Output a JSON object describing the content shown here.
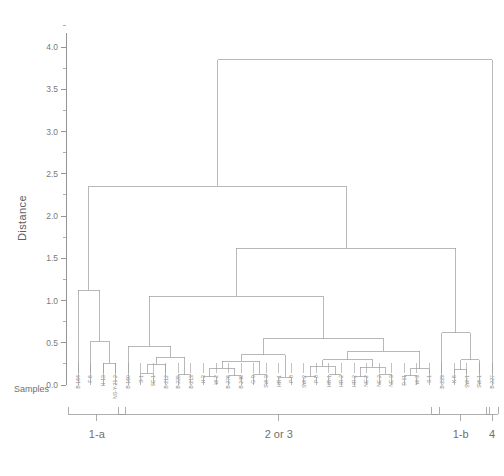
{
  "figure": {
    "kind": "dendrogram",
    "y_axis_title": "Distance",
    "x_axis_title": "Samples"
  },
  "chart_data": {
    "type": "line",
    "title": "",
    "subtitle": "",
    "xlabel": "Samples",
    "ylabel": "Distance",
    "ylim": [
      0.0,
      4.2
    ],
    "grid": false,
    "legend": "none",
    "yticks": [
      "0.0",
      "0.5",
      "1.0",
      "1.5",
      "2.0",
      "2.5",
      "3.0",
      "3.5",
      "4.0"
    ],
    "ytick_values": [
      0.0,
      0.5,
      1.0,
      1.5,
      2.0,
      2.5,
      3.0,
      3.5,
      4.0
    ],
    "minor_ticks": true,
    "leaf_labels": [
      "B-164",
      "F-6",
      "H-13",
      "NS-Y-21-2",
      "B-160",
      "S-1",
      "SE-1",
      "B-212",
      "B-225",
      "B-213",
      "H-3",
      "W-2",
      "B-276",
      "B-246",
      "G-9",
      "SW-3",
      "HR-1",
      "P-8",
      "SW-2",
      "P-8",
      "HR-1",
      "HR-2",
      "HR-2",
      "NE-2",
      "NE-2",
      "NE-3",
      "R-11",
      "W-3",
      "S-1",
      "B-223",
      "K-6",
      "SW-1",
      "SW-1",
      "B-227"
    ],
    "merge_heights": [
      1.12,
      0.52,
      0.3,
      0.19,
      0.1,
      0.18,
      0.26,
      0.33,
      0.1,
      0.14,
      0.2,
      0.08,
      0.15,
      0.12,
      0.22,
      0.1,
      0.17,
      0.09,
      0.13,
      0.21,
      0.11,
      0.16,
      0.28,
      0.36,
      0.47,
      0.6,
      1.05,
      1.62,
      2.35,
      3.85,
      0.24,
      0.46
    ],
    "root_height": 3.85,
    "second_merge_height": 2.35,
    "left_branch_height": 1.12,
    "right_branch_height": 1.62,
    "annotations": [
      "1-a",
      "2 or 3",
      "1-b",
      "4"
    ]
  },
  "cluster_brackets": [
    {
      "label": "1-a"
    },
    {
      "label": "2 or 3"
    },
    {
      "label": "1-b"
    },
    {
      "label": "4"
    }
  ],
  "colors": {
    "line": "#9a9a9a",
    "axis": "#8a8a8a",
    "text": "#6f6f6f",
    "background": "#ffffff"
  }
}
